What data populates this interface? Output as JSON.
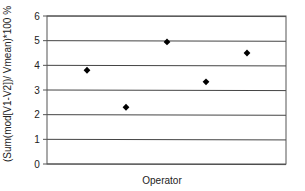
{
  "chart_data": {
    "type": "scatter",
    "title": "",
    "xlabel": "Operator",
    "ylabel": "(Sum(mod[V1-V2])/ Vmean)*100 %",
    "x": [
      1,
      2,
      3,
      4,
      5
    ],
    "series": [
      {
        "name": "Operator variation",
        "marker": "diamond",
        "color": "#000000",
        "values": [
          3.8,
          2.3,
          4.95,
          3.33,
          4.5
        ]
      }
    ],
    "ylim": [
      0,
      6
    ],
    "yticks": [
      0,
      1,
      2,
      3,
      4,
      5,
      6
    ],
    "ytick_labels": [
      "0",
      "1",
      "2",
      "3",
      "4",
      "5",
      "6"
    ],
    "xticks_visible": false,
    "grid": {
      "horizontal": true,
      "vertical": false
    },
    "legend": null
  },
  "colors": {
    "background": "#ffffff",
    "plot_border": "#555555",
    "gridline": "#444444",
    "marker": "#000000",
    "text": "#222222"
  },
  "layout": {
    "plot_left": 47,
    "plot_right": 286,
    "plot_top": 16,
    "plot_bottom": 164,
    "point_x": [
      87,
      126,
      167,
      206,
      247
    ]
  }
}
